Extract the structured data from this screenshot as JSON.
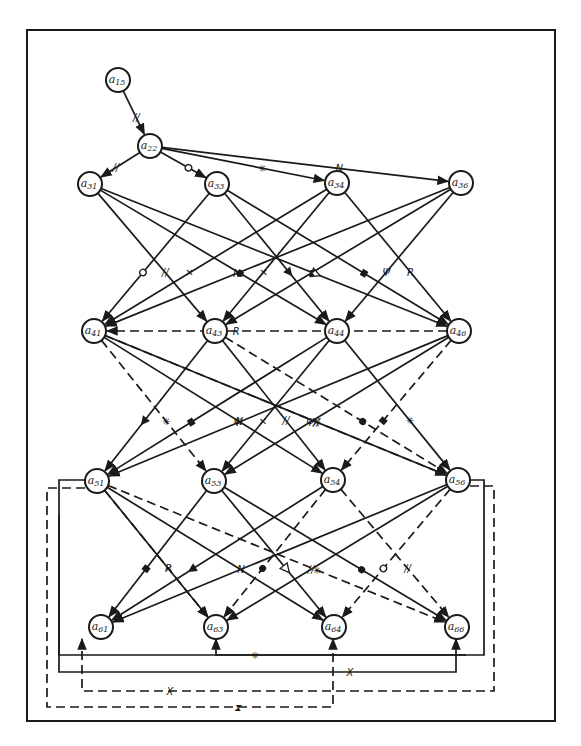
{
  "diagram": {
    "type": "directed-graph",
    "frame": {
      "x": 27,
      "y": 30,
      "width": 528,
      "height": 691
    },
    "node_radius": 12,
    "nodes": [
      {
        "id": "a15",
        "label": "a",
        "sub": "15",
        "x": 118,
        "y": 80
      },
      {
        "id": "a22",
        "label": "a",
        "sub": "22",
        "x": 150,
        "y": 146
      },
      {
        "id": "a31",
        "label": "a",
        "sub": "31",
        "x": 90,
        "y": 184
      },
      {
        "id": "a33",
        "label": "a",
        "sub": "33",
        "x": 217,
        "y": 184
      },
      {
        "id": "a34",
        "label": "a",
        "sub": "34",
        "x": 337,
        "y": 183
      },
      {
        "id": "a36",
        "label": "a",
        "sub": "36",
        "x": 461,
        "y": 183
      },
      {
        "id": "a41",
        "label": "a",
        "sub": "41",
        "x": 94,
        "y": 331
      },
      {
        "id": "a43",
        "label": "a",
        "sub": "43",
        "x": 215,
        "y": 331
      },
      {
        "id": "a44",
        "label": "a",
        "sub": "44",
        "x": 337,
        "y": 331
      },
      {
        "id": "a46",
        "label": "a",
        "sub": "46",
        "x": 459,
        "y": 331
      },
      {
        "id": "a51",
        "label": "a",
        "sub": "51",
        "x": 97,
        "y": 481
      },
      {
        "id": "a53",
        "label": "a",
        "sub": "53",
        "x": 214,
        "y": 481
      },
      {
        "id": "a54",
        "label": "a",
        "sub": "54",
        "x": 333,
        "y": 480
      },
      {
        "id": "a56",
        "label": "a",
        "sub": "56",
        "x": 458,
        "y": 480
      },
      {
        "id": "a61",
        "label": "a",
        "sub": "61",
        "x": 101,
        "y": 627
      },
      {
        "id": "a63",
        "label": "a",
        "sub": "63",
        "x": 216,
        "y": 627
      },
      {
        "id": "a64",
        "label": "a",
        "sub": "64",
        "x": 334,
        "y": 627
      },
      {
        "id": "a66",
        "label": "a",
        "sub": "66",
        "x": 457,
        "y": 627
      }
    ],
    "edges": [
      {
        "from": "a15",
        "to": "a22",
        "style": "solid",
        "mark": "//"
      },
      {
        "from": "a22",
        "to": "a31",
        "style": "solid",
        "mark": "//"
      },
      {
        "from": "a22",
        "to": "a33",
        "style": "solid",
        "mark": "o"
      },
      {
        "from": "a22",
        "to": "a34",
        "style": "solid",
        "mark": "✳"
      },
      {
        "from": "a22",
        "to": "a36",
        "style": "solid",
        "mark": "N"
      },
      {
        "from": "a31",
        "to": "a43",
        "style": "solid",
        "mark": "//"
      },
      {
        "from": "a31",
        "to": "a44",
        "style": "solid",
        "mark": "●"
      },
      {
        "from": "a31",
        "to": "a46",
        "style": "solid",
        "mark": "△"
      },
      {
        "from": "a33",
        "to": "a41",
        "style": "solid",
        "mark": "o"
      },
      {
        "from": "a33",
        "to": "a44",
        "style": "solid",
        "mark": "▲"
      },
      {
        "from": "a33",
        "to": "a46",
        "style": "solid",
        "mark": "▮"
      },
      {
        "from": "a34",
        "to": "a41",
        "style": "solid",
        "mark": "✕"
      },
      {
        "from": "a34",
        "to": "a43",
        "style": "solid",
        "mark": "✕"
      },
      {
        "from": "a34",
        "to": "a46",
        "style": "solid",
        "mark": "R"
      },
      {
        "from": "a36",
        "to": "a41",
        "style": "solid",
        "mark": "N"
      },
      {
        "from": "a36",
        "to": "a43",
        "style": "solid",
        "mark": "⧗"
      },
      {
        "from": "a36",
        "to": "a44",
        "style": "solid",
        "mark": "Ψ"
      },
      {
        "from": "a41",
        "to": "a54",
        "style": "solid",
        "mark": "N"
      },
      {
        "from": "a41",
        "to": "a56",
        "style": "solid",
        "mark": "//"
      },
      {
        "from": "a41",
        "to": "a53",
        "style": "dashed",
        "mark": "✳"
      },
      {
        "from": "a41",
        "to": "a56",
        "style": "dashed",
        "mark": "X"
      },
      {
        "from": "a43",
        "to": "a51",
        "style": "solid",
        "mark": "▲"
      },
      {
        "from": "a43",
        "to": "a54",
        "style": "solid",
        "mark": "//"
      },
      {
        "from": "a43",
        "to": "a56",
        "style": "dashed",
        "mark": "●"
      },
      {
        "from": "a44",
        "to": "a51",
        "style": "solid",
        "mark": "▮"
      },
      {
        "from": "a44",
        "to": "a53",
        "style": "solid",
        "mark": "✕"
      },
      {
        "from": "a44",
        "to": "a56",
        "style": "solid",
        "mark": "✳"
      },
      {
        "from": "a46",
        "to": "a41",
        "style": "dashed",
        "mark": "R"
      },
      {
        "from": "a46",
        "to": "a51",
        "style": "solid",
        "mark": "Ψ"
      },
      {
        "from": "a46",
        "to": "a53",
        "style": "solid",
        "mark": "Ψ"
      },
      {
        "from": "a46",
        "to": "a54",
        "style": "dashed",
        "mark": "▮"
      },
      {
        "from": "a51",
        "to": "a63",
        "style": "dashed",
        "mark": "R"
      },
      {
        "from": "a51",
        "to": "a64",
        "style": "solid",
        "mark": "N"
      },
      {
        "from": "a51",
        "to": "a66",
        "style": "dashed",
        "mark": "✳"
      },
      {
        "from": "a51",
        "to": "a63",
        "style": "solid",
        "mark": "✕"
      },
      {
        "from": "a53",
        "to": "a61",
        "style": "solid",
        "mark": "▮"
      },
      {
        "from": "a53",
        "to": "a64",
        "style": "solid",
        "mark": "△"
      },
      {
        "from": "a53",
        "to": "a66",
        "style": "solid",
        "mark": "●"
      },
      {
        "from": "a54",
        "to": "a61",
        "style": "solid",
        "mark": "▲"
      },
      {
        "from": "a54",
        "to": "a63",
        "style": "dashed",
        "mark": "●"
      },
      {
        "from": "a54",
        "to": "a66",
        "style": "dashed",
        "mark": "//"
      },
      {
        "from": "a56",
        "to": "a61",
        "style": "solid",
        "mark": ""
      },
      {
        "from": "a56",
        "to": "a64",
        "style": "dashed",
        "mark": "o"
      },
      {
        "from": "a56",
        "to": "a63",
        "style": "solid",
        "mark": "//"
      },
      {
        "from": "a51",
        "to": "a63",
        "style": "solid-loop",
        "mark": "✳"
      },
      {
        "from": "a51",
        "to": "a66",
        "style": "solid-loop",
        "mark": "X"
      },
      {
        "from": "a56",
        "to": "a61",
        "style": "dashed-loop",
        "mark": "X"
      },
      {
        "from": "a51",
        "to": "a64",
        "style": "dashed-loop",
        "mark": "⧗"
      }
    ],
    "edge_marks_legend": [
      "//",
      "o",
      "●",
      "△",
      "▲",
      "▮",
      "✕",
      "✳",
      "N",
      "R",
      "X",
      "Ψ",
      "⧗"
    ]
  }
}
